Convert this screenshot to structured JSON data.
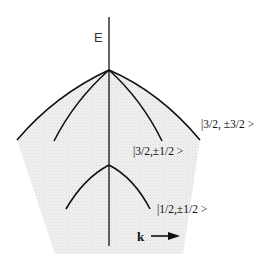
{
  "diagram": {
    "axis_label": "E",
    "bands": [
      {
        "name": "heavy-hole",
        "label": "|3/2, ±3/2 >"
      },
      {
        "name": "light-hole",
        "label": "|3/2,±1/2 >"
      },
      {
        "name": "split-off",
        "label": "|1/2,±1/2 >"
      }
    ],
    "k_label": "k",
    "colors": {
      "line": "#111111",
      "shade": "#ececec",
      "background": "#ffffff"
    }
  }
}
